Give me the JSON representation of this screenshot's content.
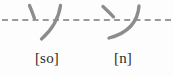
{
  "figure": {
    "background_color": "#fdfdfd",
    "guideline": {
      "style": "dashed",
      "color": "#9a9a9a"
    },
    "stroke_color": "#8c8c8c",
    "label_color": "#2b2b2b",
    "characters": [
      {
        "glyph": "ソ",
        "romaji": "so",
        "label": "[so]",
        "name": "katakana-so"
      },
      {
        "glyph": "ン",
        "romaji": "n",
        "label": "[n]",
        "name": "katakana-n"
      }
    ]
  }
}
